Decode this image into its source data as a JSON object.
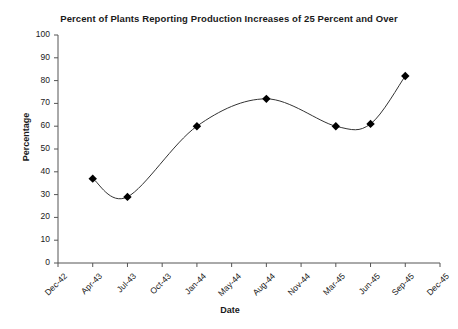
{
  "chart_data": {
    "type": "line",
    "title": "Percent of Plants Reporting Production Increases of 25 Percent and Over",
    "xlabel": "Date",
    "ylabel": "Percentage",
    "ylim": [
      0,
      100
    ],
    "yticks": [
      0,
      10,
      20,
      30,
      40,
      50,
      60,
      70,
      80,
      90,
      100
    ],
    "xticks": [
      "Dec-42",
      "Apr-43",
      "Jul-43",
      "Oct-43",
      "Jan-44",
      "May-44",
      "Aug-44",
      "Nov-44",
      "Mar-45",
      "Jun-45",
      "Sep-45",
      "Dec-45"
    ],
    "grid": false,
    "legend": false,
    "marker": "diamond",
    "line_color": "#333333",
    "marker_color": "#000000",
    "background": "#ffffff",
    "series": [
      {
        "name": "Percent of plants",
        "x": [
          "Apr-43",
          "Jul-43",
          "Jan-44",
          "Aug-44",
          "Mar-45",
          "Jun-45",
          "Sep-45"
        ],
        "values": [
          37,
          29,
          60,
          72,
          60,
          61,
          82
        ]
      }
    ],
    "points": [
      {
        "x": "Apr-43",
        "y": 37
      },
      {
        "x": "Jul-43",
        "y": 29
      },
      {
        "x": "Jan-44",
        "y": 60
      },
      {
        "x": "Aug-44",
        "y": 72
      },
      {
        "x": "Mar-45",
        "y": 60
      },
      {
        "x": "Jun-45",
        "y": 61
      },
      {
        "x": "Sep-45",
        "y": 82
      }
    ]
  }
}
